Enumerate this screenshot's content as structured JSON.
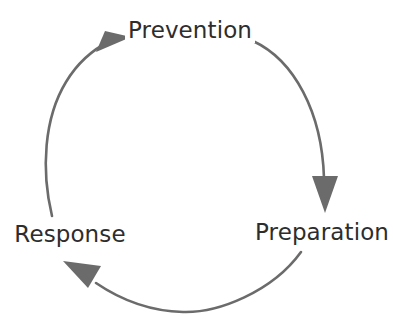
{
  "diagram": {
    "type": "cycle",
    "title": "",
    "background_color": "#ffffff",
    "arc_color": "#6b6b6b",
    "arrow_color": "#6b6b6b",
    "text_color": "#2d2d2d",
    "direction": "clockwise",
    "stages": [
      {
        "id": "prevention",
        "label": "Prevention",
        "position": "top"
      },
      {
        "id": "preparation",
        "label": "Preparation",
        "position": "bottom-right"
      },
      {
        "id": "response",
        "label": "Response",
        "position": "bottom-left"
      }
    ],
    "arrows": [
      {
        "id": "prevention-to-preparation",
        "from": "Prevention",
        "to": "Preparation"
      },
      {
        "id": "preparation-to-response",
        "from": "Preparation",
        "to": "Response"
      },
      {
        "id": "response-to-prevention",
        "from": "Response",
        "to": "Prevention"
      }
    ]
  }
}
